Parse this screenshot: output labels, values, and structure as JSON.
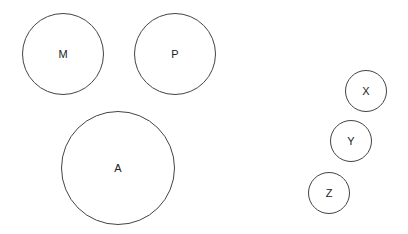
{
  "diagram": {
    "background": "#ffffff",
    "stroke_color": "#444444",
    "label_color": "#222222",
    "nodes": [
      {
        "id": "M",
        "label": "M",
        "cx": 63,
        "cy": 54,
        "r": 41
      },
      {
        "id": "P",
        "label": "P",
        "cx": 175,
        "cy": 54,
        "r": 41
      },
      {
        "id": "A",
        "label": "A",
        "cx": 118,
        "cy": 168,
        "r": 57
      },
      {
        "id": "X",
        "label": "X",
        "cx": 366,
        "cy": 91,
        "r": 21
      },
      {
        "id": "Y",
        "label": "Y",
        "cx": 351,
        "cy": 141,
        "r": 21
      },
      {
        "id": "Z",
        "label": "Z",
        "cx": 329,
        "cy": 193,
        "r": 21
      }
    ]
  }
}
